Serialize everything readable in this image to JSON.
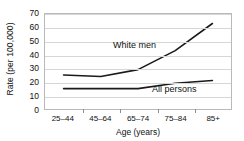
{
  "chart_data": {
    "type": "line",
    "title": "",
    "xlabel": "Age (years)",
    "ylabel": "Rate (per 100,000)",
    "categories": [
      "25–44",
      "45–64",
      "65–74",
      "75–84",
      "85+"
    ],
    "ylim": [
      0,
      70
    ],
    "yticks": [
      0,
      10,
      20,
      30,
      40,
      50,
      60,
      70
    ],
    "ytick_labels": [
      "0",
      "10",
      "20",
      "30",
      "40",
      "50",
      "60",
      "70"
    ],
    "grid": true,
    "legend_position": "inline-annotations",
    "series": [
      {
        "name": "White men",
        "values": [
          25,
          24,
          29,
          43,
          63
        ],
        "color": "#1a1a1a",
        "annotation": "White men"
      },
      {
        "name": "All persons",
        "values": [
          15,
          15,
          15,
          19,
          21
        ],
        "color": "#1a1a1a",
        "annotation": "All persons"
      }
    ]
  },
  "axes": {
    "y_title": "Rate (per 100,000)",
    "x_title": "Age (years)"
  },
  "colors": {
    "line": "#1a1a1a",
    "grid": "#d6d6d6",
    "frame": "#b9b9b9",
    "text": "#111111",
    "background": "#ffffff"
  }
}
